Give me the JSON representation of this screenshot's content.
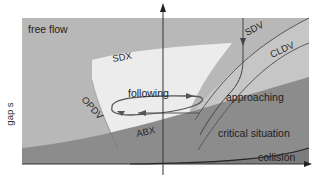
{
  "diagram": {
    "type": "car-following regimes",
    "axes": {
      "y_label": "gap s",
      "x_label": ""
    },
    "regions": {
      "free_flow": "free flow",
      "following": "following",
      "approaching": "approaching",
      "critical": "critical situation",
      "collision": "collision"
    },
    "thresholds": {
      "sdx": "SDX",
      "sdv": "SDV",
      "cldv": "CLDV",
      "opdv": "OPDV",
      "abx": "ABX"
    },
    "colors": {
      "free_flow": "#b9b9b9",
      "following": "#ececec",
      "approaching": "#c4c4c4",
      "critical": "#8a8a8a",
      "collision": "#7a7a7a",
      "lines": "#555555",
      "axis": "#222222"
    }
  }
}
